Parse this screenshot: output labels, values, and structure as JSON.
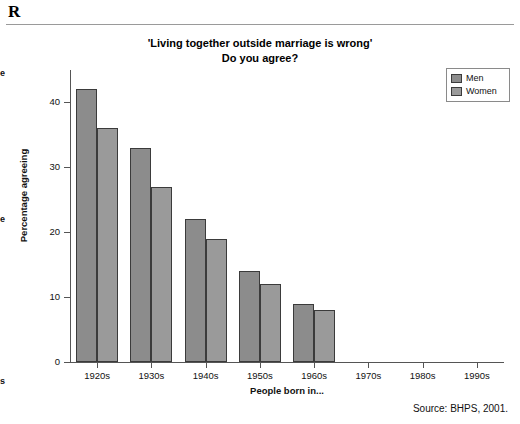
{
  "header": {
    "letter": "R",
    "rule": true
  },
  "margin_fragments": [
    {
      "text": "e"
    },
    {
      "text": "e"
    },
    {
      "text": "s"
    }
  ],
  "chart_title_line1": "'Living together outside marriage is wrong'",
  "chart_title_line2": "Do you agree?",
  "source_note": "Source: BHPS, 2001.",
  "legend": {
    "position": "top-right",
    "entries": [
      {
        "label": "Men",
        "color": "#8c8c8c"
      },
      {
        "label": "Women",
        "color": "#9a9a9a"
      }
    ]
  },
  "chart_data": {
    "type": "bar",
    "title": "'Living together outside marriage is wrong' Do you agree?",
    "xlabel": "People born in...",
    "ylabel": "Percentage agreeing",
    "categories": [
      "1920s",
      "1930s",
      "1940s",
      "1950s",
      "1960s",
      "1970s",
      "1980s",
      "1990s"
    ],
    "series": [
      {
        "name": "Men",
        "color": "#8c8c8c",
        "values": [
          42,
          33,
          22,
          14,
          9,
          0,
          0,
          0
        ]
      },
      {
        "name": "Women",
        "color": "#9a9a9a",
        "values": [
          36,
          27,
          19,
          12,
          8,
          0,
          0,
          0
        ]
      }
    ],
    "ylim": [
      0,
      45
    ],
    "yticks": [
      0,
      10,
      20,
      30,
      40
    ],
    "ytick_labels": [
      "0",
      "10",
      "20",
      "30",
      "40"
    ],
    "grid": false,
    "legend_position": "top right",
    "source": "Source: BHPS, 2001."
  }
}
